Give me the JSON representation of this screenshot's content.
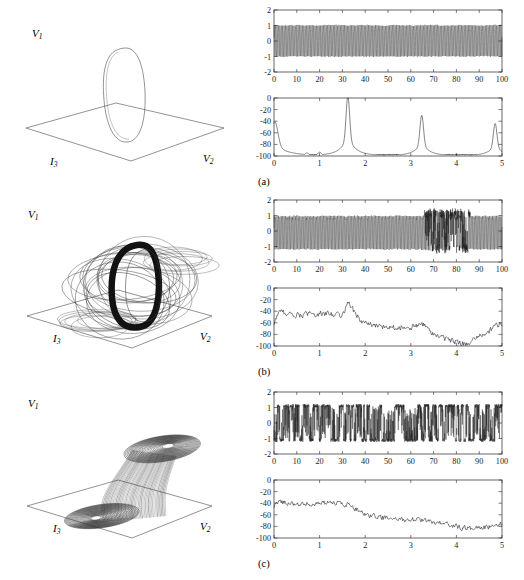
{
  "figure": {
    "panels": [
      {
        "tag": "(a)",
        "portrait": {
          "axes": {
            "vertical": "V1",
            "depth": "I3",
            "horizontal": "V2"
          },
          "description": "single limit cycle orbit"
        }
      },
      {
        "tag": "(b)",
        "portrait": {
          "axes": {
            "vertical": "V1",
            "depth": "I3",
            "horizontal": "V2"
          },
          "description": "thick torus quasi-periodic attractor"
        }
      },
      {
        "tag": "(c)",
        "portrait": {
          "axes": {
            "vertical": "V1",
            "depth": "I3",
            "horizontal": "V2"
          },
          "description": "double scroll chaotic attractor"
        }
      }
    ]
  },
  "chart_data": [
    {
      "id": "a-timeseries",
      "type": "line",
      "panel": "(a)",
      "title": "",
      "xlabel": "",
      "ylabel": "",
      "xlim": [
        0,
        100
      ],
      "ylim": [
        -2,
        2
      ],
      "xticks": [
        0,
        10,
        20,
        30,
        40,
        50,
        60,
        70,
        80,
        90,
        100
      ],
      "yticks": [
        -2,
        -1,
        0,
        1,
        2
      ],
      "xticklabels": [
        "0",
        "10",
        "20",
        "30",
        "40",
        "50",
        "60",
        "70",
        "80",
        "90",
        "100"
      ],
      "yticklabels": [
        "-2",
        "-1",
        "0",
        "1",
        "2"
      ],
      "grid": false,
      "legend": null,
      "series": [
        {
          "name": "V1(t)",
          "waveform": "periodic",
          "frequency": 1.62,
          "amplitude_high": 1.25,
          "amplitude_low": -1.1,
          "description": "dense uniform periodic oscillation filling band between -1.1 and 1.25 over the whole record"
        }
      ]
    },
    {
      "id": "a-spectrum",
      "type": "line",
      "panel": "(a)",
      "title": "",
      "xlabel": "",
      "ylabel": "",
      "xlim": [
        0,
        5
      ],
      "ylim": [
        -100,
        0
      ],
      "xticks": [
        0,
        1,
        2,
        3,
        4,
        5
      ],
      "yticks": [
        -100,
        -80,
        -60,
        -40,
        -20,
        0
      ],
      "xticklabels": [
        "0",
        "1",
        "2",
        "3",
        "4",
        "5"
      ],
      "yticklabels": [
        "-100",
        "-80",
        "-60",
        "-40",
        "-20",
        "0"
      ],
      "grid": false,
      "legend": null,
      "series": [
        {
          "name": "power spectrum",
          "description": "sharp discrete harmonic peaks on a low noise floor near -100 dB",
          "peaks": [
            {
              "x": 0.02,
              "y": -55
            },
            {
              "x": 0.72,
              "y": -96
            },
            {
              "x": 1.0,
              "y": -95
            },
            {
              "x": 1.62,
              "y": -21
            },
            {
              "x": 3.24,
              "y": -46
            },
            {
              "x": 4.85,
              "y": -57
            }
          ],
          "noise_floor": -100
        }
      ]
    },
    {
      "id": "b-timeseries",
      "type": "line",
      "panel": "(b)",
      "title": "",
      "xlabel": "",
      "ylabel": "",
      "xlim": [
        0,
        100
      ],
      "ylim": [
        -2,
        2
      ],
      "xticks": [
        0,
        10,
        20,
        30,
        40,
        50,
        60,
        70,
        80,
        90,
        100
      ],
      "yticks": [
        -2,
        -1,
        0,
        1,
        2
      ],
      "xticklabels": [
        "0",
        "10",
        "20",
        "30",
        "40",
        "50",
        "60",
        "70",
        "80",
        "90",
        "100"
      ],
      "yticklabels": [
        "-2",
        "-1",
        "0",
        "1",
        "2"
      ],
      "grid": false,
      "legend": null,
      "series": [
        {
          "name": "V1(t)",
          "waveform": "intermittent",
          "frequency": 1.62,
          "amplitude_high": 1.3,
          "amplitude_low": -1.25,
          "burst_window": [
            66,
            86
          ],
          "description": "dense oscillation interrupted by a laminar burst episode between t=66 and t=86"
        }
      ]
    },
    {
      "id": "b-spectrum",
      "type": "line",
      "panel": "(b)",
      "title": "",
      "xlabel": "",
      "ylabel": "",
      "xlim": [
        0,
        5
      ],
      "ylim": [
        -100,
        0
      ],
      "xticks": [
        0,
        1,
        2,
        3,
        4,
        5
      ],
      "yticks": [
        -100,
        -80,
        -60,
        -40,
        -20,
        0
      ],
      "xticklabels": [
        "0",
        "1",
        "2",
        "3",
        "4",
        "5"
      ],
      "yticklabels": [
        "-100",
        "-80",
        "-60",
        "-40",
        "-20",
        "0"
      ],
      "grid": false,
      "legend": null,
      "series": [
        {
          "name": "power spectrum",
          "description": "broadband noisy spectrum, plateau near -45 dB up to f=1.6 with a peak at 1.62, then stepping down to -70 dB and -85 dB",
          "envelope": [
            {
              "x": 0.0,
              "y": -62
            },
            {
              "x": 0.1,
              "y": -40
            },
            {
              "x": 0.5,
              "y": -47
            },
            {
              "x": 1.0,
              "y": -44
            },
            {
              "x": 1.5,
              "y": -46
            },
            {
              "x": 1.62,
              "y": -24
            },
            {
              "x": 1.9,
              "y": -57
            },
            {
              "x": 2.2,
              "y": -66
            },
            {
              "x": 3.0,
              "y": -68
            },
            {
              "x": 3.25,
              "y": -62
            },
            {
              "x": 3.5,
              "y": -80
            },
            {
              "x": 4.2,
              "y": -98
            },
            {
              "x": 4.6,
              "y": -80
            },
            {
              "x": 4.95,
              "y": -62
            }
          ],
          "noise_amplitude": 7
        }
      ]
    },
    {
      "id": "c-timeseries",
      "type": "line",
      "panel": "(c)",
      "title": "",
      "xlabel": "",
      "ylabel": "",
      "xlim": [
        0,
        100
      ],
      "ylim": [
        -2,
        2
      ],
      "xticks": [
        0,
        10,
        20,
        30,
        40,
        50,
        60,
        70,
        80,
        90,
        100
      ],
      "yticks": [
        -2,
        -1,
        0,
        1,
        2
      ],
      "xticklabels": [
        "0",
        "10",
        "20",
        "30",
        "40",
        "50",
        "60",
        "70",
        "80",
        "90",
        "100"
      ],
      "yticklabels": [
        "-2",
        "-1",
        "0",
        "1",
        "2"
      ],
      "grid": false,
      "legend": null,
      "series": [
        {
          "name": "V1(t)",
          "waveform": "chaotic-switching",
          "amplitude_high": 1.2,
          "amplitude_low": -1.2,
          "description": "chaotic double-scroll switching irregularly between the +1 and -1 plateau levels"
        }
      ]
    },
    {
      "id": "c-spectrum",
      "type": "line",
      "panel": "(c)",
      "title": "",
      "xlabel": "",
      "ylabel": "",
      "xlim": [
        0,
        5
      ],
      "ylim": [
        -100,
        0
      ],
      "xticks": [
        0,
        1,
        2,
        3,
        4,
        5
      ],
      "yticks": [
        -100,
        -80,
        -60,
        -40,
        -20,
        0
      ],
      "xticklabels": [
        "0",
        "1",
        "2",
        "3",
        "4",
        "5"
      ],
      "yticklabels": [
        "-100",
        "-80",
        "-60",
        "-40",
        "-20",
        "0"
      ],
      "grid": false,
      "legend": null,
      "series": [
        {
          "name": "power spectrum",
          "description": "broadband chaotic spectrum decaying from about -38 dB near DC to about -80 dB at f=5",
          "envelope": [
            {
              "x": 0.0,
              "y": -48
            },
            {
              "x": 0.1,
              "y": -36
            },
            {
              "x": 0.5,
              "y": -42
            },
            {
              "x": 1.0,
              "y": -40
            },
            {
              "x": 1.5,
              "y": -41
            },
            {
              "x": 1.7,
              "y": -44
            },
            {
              "x": 2.0,
              "y": -60
            },
            {
              "x": 2.3,
              "y": -64
            },
            {
              "x": 2.7,
              "y": -68
            },
            {
              "x": 3.2,
              "y": -69
            },
            {
              "x": 3.7,
              "y": -74
            },
            {
              "x": 4.1,
              "y": -82
            },
            {
              "x": 4.5,
              "y": -84
            },
            {
              "x": 4.95,
              "y": -77
            }
          ],
          "noise_amplitude": 6
        }
      ]
    }
  ]
}
